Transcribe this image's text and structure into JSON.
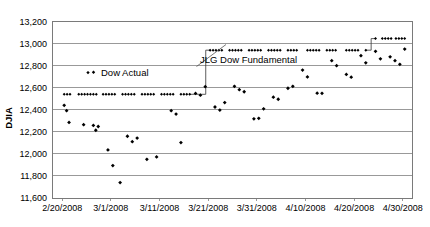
{
  "chart_data": {
    "type": "scatter",
    "title": "",
    "xlabel": "",
    "ylabel": "DJIA",
    "ylim": [
      11600,
      13200
    ],
    "ytick_labels": [
      "13,200",
      "13,000",
      "12,800",
      "12,600",
      "12,400",
      "12,200",
      "12,000",
      "11,800",
      "11,600"
    ],
    "ytick_values": [
      13200,
      13000,
      12800,
      12600,
      12400,
      12200,
      12000,
      11800,
      11600
    ],
    "xtick_labels": [
      "2/20/2008",
      "3/1/2008",
      "3/11/2008",
      "3/21/2008",
      "3/31/2008",
      "4/10/2008",
      "4/20/2008",
      "4/30/2008"
    ],
    "xtick_values": [
      0,
      10,
      20,
      30,
      40,
      50,
      60,
      70
    ],
    "xlim": [
      -2,
      72
    ],
    "grid": true,
    "legend_position": "inside-upper-left",
    "annotations": [
      {
        "text": "Dow Actual",
        "x": 12,
        "y": 12690
      },
      {
        "text": "JLG Dow Fundamental",
        "x": 36,
        "y": 12870
      }
    ],
    "series": [
      {
        "name": "Dow Actual",
        "marker": "diamond",
        "color": "#000000",
        "points": [
          [
            0.4,
            12440
          ],
          [
            0.9,
            12392
          ],
          [
            1.4,
            12285
          ],
          [
            4.4,
            12265
          ],
          [
            6.4,
            12258
          ],
          [
            6.9,
            12214
          ],
          [
            7.4,
            12248
          ],
          [
            9.4,
            12036
          ],
          [
            10.4,
            11894
          ],
          [
            11.9,
            11740
          ],
          [
            13.4,
            12160
          ],
          [
            14.4,
            12111
          ],
          [
            15.4,
            12143
          ],
          [
            17.4,
            11951
          ],
          [
            19.4,
            11972
          ],
          [
            22.4,
            12392
          ],
          [
            23.4,
            12361
          ],
          [
            24.4,
            12102
          ],
          [
            27.4,
            12548
          ],
          [
            28.4,
            12532
          ],
          [
            29.4,
            12609
          ],
          [
            31.4,
            12425
          ],
          [
            32.4,
            12397
          ],
          [
            33.4,
            12465
          ],
          [
            35.4,
            12612
          ],
          [
            36.4,
            12582
          ],
          [
            37.4,
            12563
          ],
          [
            39.4,
            12318
          ],
          [
            40.4,
            12322
          ],
          [
            41.4,
            12408
          ],
          [
            43.4,
            12514
          ],
          [
            44.4,
            12495
          ],
          [
            46.4,
            12595
          ],
          [
            47.4,
            12612
          ],
          [
            49.4,
            12760
          ],
          [
            50.4,
            12698
          ],
          [
            52.4,
            12550
          ],
          [
            53.4,
            12549
          ],
          [
            55.4,
            12845
          ],
          [
            56.4,
            12800
          ],
          [
            58.4,
            12720
          ],
          [
            59.4,
            12695
          ],
          [
            61.4,
            12890
          ],
          [
            62.4,
            12825
          ],
          [
            64.4,
            12930
          ],
          [
            65.4,
            12862
          ],
          [
            67.4,
            12880
          ],
          [
            68.4,
            12845
          ],
          [
            69.4,
            12812
          ],
          [
            70.4,
            12950
          ]
        ]
      },
      {
        "name": "JLG Dow Fundamental",
        "marker": "step",
        "color": "#000000",
        "level_1": 12540,
        "level_2": 12940,
        "level_3": 13045,
        "step_1_x": 29.5,
        "step_2_x": 63.5,
        "points": [
          [
            0.4,
            12540
          ],
          [
            1.0,
            12540
          ],
          [
            1.6,
            12540
          ],
          [
            3.4,
            12540
          ],
          [
            4.0,
            12540
          ],
          [
            4.6,
            12540
          ],
          [
            5.2,
            12540
          ],
          [
            5.8,
            12540
          ],
          [
            6.4,
            12540
          ],
          [
            7.0,
            12540
          ],
          [
            8.4,
            12540
          ],
          [
            9.0,
            12540
          ],
          [
            9.6,
            12540
          ],
          [
            10.2,
            12540
          ],
          [
            10.8,
            12540
          ],
          [
            12.4,
            12540
          ],
          [
            13.0,
            12540
          ],
          [
            13.6,
            12540
          ],
          [
            14.2,
            12540
          ],
          [
            14.8,
            12540
          ],
          [
            16.4,
            12540
          ],
          [
            17.0,
            12540
          ],
          [
            17.6,
            12540
          ],
          [
            18.2,
            12540
          ],
          [
            18.8,
            12540
          ],
          [
            20.4,
            12540
          ],
          [
            21.0,
            12540
          ],
          [
            21.6,
            12540
          ],
          [
            22.2,
            12540
          ],
          [
            22.8,
            12540
          ],
          [
            24.4,
            12540
          ],
          [
            25.0,
            12540
          ],
          [
            25.6,
            12540
          ],
          [
            26.2,
            12540
          ],
          [
            30.4,
            12940
          ],
          [
            31.0,
            12940
          ],
          [
            31.6,
            12940
          ],
          [
            32.2,
            12940
          ],
          [
            32.8,
            12940
          ],
          [
            34.4,
            12940
          ],
          [
            35.0,
            12940
          ],
          [
            35.6,
            12940
          ],
          [
            36.2,
            12940
          ],
          [
            36.8,
            12940
          ],
          [
            38.4,
            12940
          ],
          [
            39.0,
            12940
          ],
          [
            39.6,
            12940
          ],
          [
            40.2,
            12940
          ],
          [
            40.8,
            12940
          ],
          [
            42.4,
            12940
          ],
          [
            43.0,
            12940
          ],
          [
            43.6,
            12940
          ],
          [
            44.2,
            12940
          ],
          [
            44.8,
            12940
          ],
          [
            46.4,
            12940
          ],
          [
            47.0,
            12940
          ],
          [
            47.6,
            12940
          ],
          [
            48.2,
            12940
          ],
          [
            50.4,
            12940
          ],
          [
            51.0,
            12940
          ],
          [
            51.6,
            12940
          ],
          [
            52.2,
            12940
          ],
          [
            52.8,
            12940
          ],
          [
            54.4,
            12940
          ],
          [
            55.0,
            12940
          ],
          [
            55.6,
            12940
          ],
          [
            56.2,
            12940
          ],
          [
            58.4,
            12940
          ],
          [
            59.0,
            12940
          ],
          [
            59.6,
            12940
          ],
          [
            60.2,
            12940
          ],
          [
            60.8,
            12940
          ],
          [
            62.4,
            12940
          ],
          [
            64.4,
            13045
          ],
          [
            65.8,
            13045
          ],
          [
            66.4,
            13045
          ],
          [
            67.0,
            13045
          ],
          [
            67.6,
            13045
          ],
          [
            68.6,
            13045
          ],
          [
            69.2,
            13045
          ],
          [
            69.8,
            13045
          ],
          [
            70.4,
            13045
          ]
        ]
      }
    ]
  },
  "legend": {
    "dow_actual_label": "Dow Actual"
  },
  "callout": {
    "fundamental_label": "JLG Dow Fundamental"
  }
}
